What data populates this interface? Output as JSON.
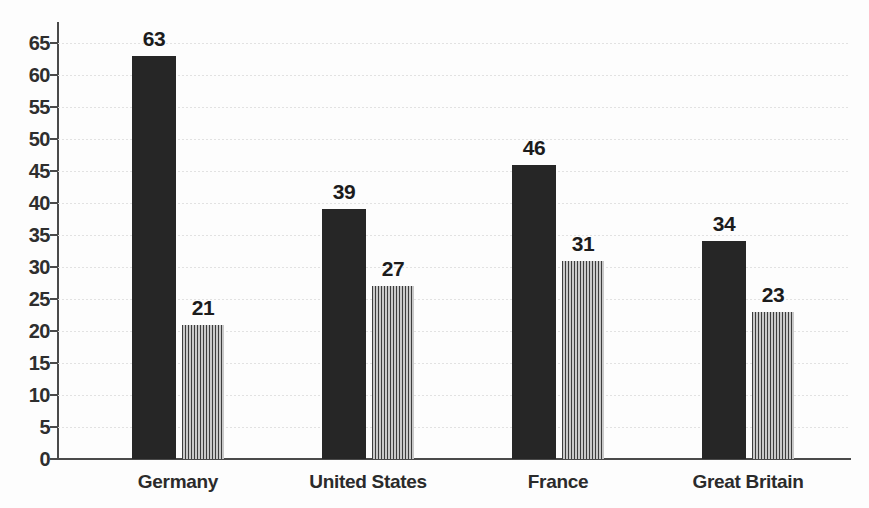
{
  "chart_data": {
    "type": "bar",
    "title": "",
    "subtitle": "",
    "xlabel": "",
    "ylabel": "",
    "categories": [
      "Germany",
      "United States",
      "France",
      "Great Britain"
    ],
    "series": [
      {
        "name": "series-1",
        "style": "solid-dark",
        "color": "#262626",
        "values": [
          63,
          39,
          46,
          34
        ]
      },
      {
        "name": "series-2",
        "style": "vertical-hatch-gray",
        "color": "#9a9a9a",
        "values": [
          21,
          27,
          31,
          23
        ]
      }
    ],
    "ylim": [
      0,
      65
    ],
    "ytick_values": [
      0,
      5,
      10,
      15,
      20,
      25,
      30,
      35,
      40,
      45,
      50,
      55,
      60,
      65
    ],
    "ytick_labels": [
      "0",
      "5",
      "10",
      "15",
      "20",
      "25",
      "30",
      "35",
      "40",
      "45",
      "50",
      "55",
      "60",
      "65"
    ],
    "grid": true,
    "grid_color": "#e2e2e2",
    "legend": false,
    "legend_position": "none",
    "data_labels": true,
    "axis_color": "#4a4a4a",
    "background": "#fdfdfd",
    "annotations": []
  }
}
